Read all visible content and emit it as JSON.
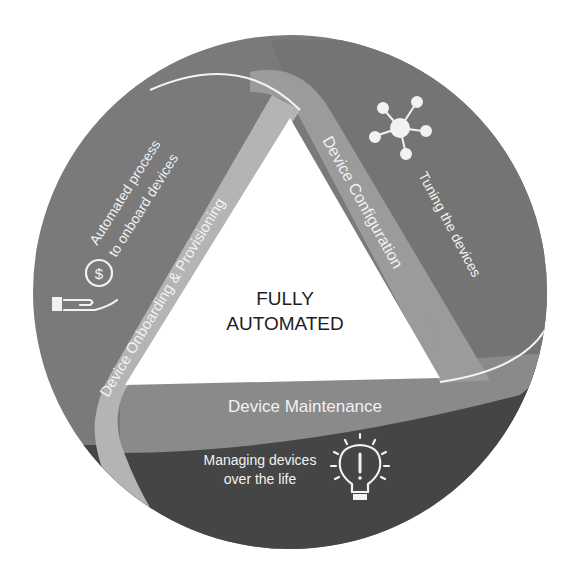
{
  "diagram": {
    "center_label": {
      "line1": "FULLY",
      "line2": "AUTOMATED"
    },
    "stages": [
      {
        "id": "onboarding",
        "ribbon_label": "Device Onboarding & Provisioning",
        "description": [
          "Automated process",
          "to onboard devices"
        ],
        "icon": "hand-with-coin-icon"
      },
      {
        "id": "configuration",
        "ribbon_label": "Device Configuration",
        "description": [
          "Tuning the  devices"
        ],
        "icon": "network-hub-icon"
      },
      {
        "id": "maintenance",
        "ribbon_label": "Device Maintenance",
        "description": [
          "Managing devices",
          "over the life"
        ],
        "icon": "lightbulb-alert-icon"
      }
    ],
    "colors": {
      "sector_top_left": "#7a7a7a",
      "sector_top_right": "#747474",
      "sector_bottom": "#454545",
      "ribbon_onboarding": "#b4b4b4",
      "ribbon_configuration": "#9b9b9b",
      "ribbon_maintenance": "#8a8a8a",
      "center": "#ffffff",
      "text_light": "#f2f2f2",
      "text_dark": "#1e1e1e"
    }
  }
}
